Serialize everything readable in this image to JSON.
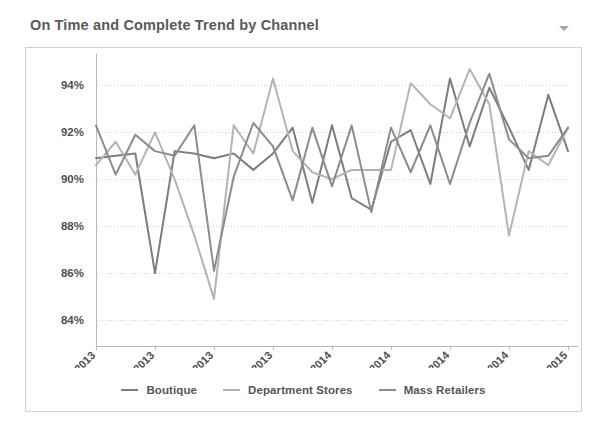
{
  "widget": {
    "title": "On Time and Complete Trend by Channel",
    "menu_icon": "chevron-down-icon"
  },
  "chart_data": {
    "type": "line",
    "title": "On Time and Complete Trend by Channel",
    "xlabel": "",
    "ylabel": "",
    "ylim": [
      84,
      95
    ],
    "yticks": [
      84,
      86,
      88,
      90,
      92,
      94
    ],
    "ytick_labels": [
      "84%",
      "86%",
      "88%",
      "90%",
      "92%",
      "94%"
    ],
    "grid": true,
    "legend_position": "bottom",
    "x": [
      "Jan-2013",
      "Feb-2013",
      "Mar-2013",
      "Apr-2013",
      "May-2013",
      "Jun-2013",
      "Jul-2013",
      "Aug-2013",
      "Sep-2013",
      "Oct-2013",
      "Nov-2013",
      "Dec-2013",
      "Jan-2014",
      "Feb-2014",
      "Mar-2014",
      "Apr-2014",
      "May-2014",
      "Jun-2014",
      "Jul-2014",
      "Aug-2014",
      "Sep-2014",
      "Oct-2014",
      "Nov-2014",
      "Dec-2014",
      "Jan-2015"
    ],
    "xtick_labels": [
      "Jan-2013",
      "Apr-2013",
      "Jul-2013",
      "Oct-2013",
      "Jan-2014",
      "Apr-2014",
      "Jul-2014",
      "Oct-2014",
      "Jan-2015"
    ],
    "xtick_indices": [
      0,
      3,
      6,
      9,
      12,
      15,
      18,
      21,
      24
    ],
    "series": [
      {
        "name": "Boutique",
        "color": "#7d7d7d",
        "values": [
          90.9,
          91.0,
          91.1,
          86.0,
          91.2,
          91.1,
          90.9,
          91.1,
          90.4,
          91.1,
          92.2,
          89.0,
          92.3,
          89.2,
          88.7,
          91.6,
          92.1,
          89.8,
          94.3,
          91.4,
          93.9,
          92.2,
          90.4,
          93.6,
          91.2
        ]
      },
      {
        "name": "Department Stores",
        "color": "#b4b4b4",
        "values": [
          90.6,
          91.6,
          90.2,
          92.0,
          90.0,
          87.6,
          84.9,
          92.3,
          91.1,
          94.3,
          91.2,
          90.3,
          90.0,
          90.4,
          90.4,
          90.4,
          94.1,
          93.2,
          92.6,
          94.7,
          93.2,
          87.6,
          91.2,
          90.6,
          92.2
        ]
      },
      {
        "name": "Mass Retailers",
        "color": "#8c8c8c",
        "values": [
          92.3,
          90.2,
          91.9,
          91.2,
          91.0,
          92.3,
          86.1,
          90.1,
          92.4,
          91.4,
          89.1,
          92.2,
          89.7,
          92.3,
          88.6,
          92.2,
          90.3,
          92.3,
          89.8,
          92.4,
          94.5,
          91.7,
          90.9,
          91.0,
          92.2
        ]
      }
    ]
  },
  "legend": {
    "items": [
      {
        "label": "Boutique",
        "color": "#7d7d7d"
      },
      {
        "label": "Department Stores",
        "color": "#b4b4b4"
      },
      {
        "label": "Mass Retailers",
        "color": "#8c8c8c"
      }
    ]
  }
}
